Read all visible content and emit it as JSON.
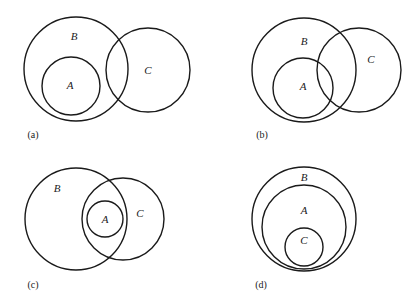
{
  "figure": {
    "panels": [
      {
        "id": "a",
        "caption": "(a)",
        "caption_pos": [
          33,
          136
        ],
        "description": "A is a subset of B; C overlaps B but not A",
        "sets": [
          {
            "name": "B",
            "cx": 76,
            "cy": 69,
            "r": 52,
            "label_pos": [
              74,
              37
            ]
          },
          {
            "name": "A",
            "cx": 71,
            "cy": 86,
            "r": 29,
            "label_pos": [
              70,
              86
            ]
          },
          {
            "name": "C",
            "cx": 148,
            "cy": 70,
            "r": 42,
            "label_pos": [
              148,
              71
            ]
          }
        ]
      },
      {
        "id": "b",
        "caption": "(b)",
        "caption_pos": [
          262,
          136
        ],
        "description": "A is a subset of B; C overlaps both A and B",
        "sets": [
          {
            "name": "B",
            "cx": 304,
            "cy": 70,
            "r": 52,
            "label_pos": [
              304,
              42
            ]
          },
          {
            "name": "A",
            "cx": 303,
            "cy": 88,
            "r": 30,
            "label_pos": [
              303,
              87
            ]
          },
          {
            "name": "C",
            "cx": 359,
            "cy": 70,
            "r": 42,
            "label_pos": [
              371,
              60
            ]
          }
        ]
      },
      {
        "id": "c",
        "caption": "(c)",
        "caption_pos": [
          33,
          286
        ],
        "description": "A is a subset of both B and C; B and C overlap",
        "sets": [
          {
            "name": "B",
            "cx": 76,
            "cy": 219,
            "r": 51,
            "label_pos": [
              57,
              189
            ]
          },
          {
            "name": "C",
            "cx": 123,
            "cy": 219,
            "r": 41,
            "label_pos": [
              140,
              214
            ]
          },
          {
            "name": "A",
            "cx": 105,
            "cy": 219,
            "r": 18,
            "label_pos": [
              105,
              220
            ]
          }
        ]
      },
      {
        "id": "d",
        "caption": "(d)",
        "caption_pos": [
          261,
          286
        ],
        "description": "C is a subset of A, which is a subset of B",
        "sets": [
          {
            "name": "B",
            "cx": 304,
            "cy": 219,
            "r": 52,
            "label_pos": [
              304,
              178
            ]
          },
          {
            "name": "A",
            "cx": 304,
            "cy": 227,
            "r": 42,
            "label_pos": [
              304,
              211
            ]
          },
          {
            "name": "C",
            "cx": 304,
            "cy": 247,
            "r": 19,
            "label_pos": [
              304,
              241
            ]
          }
        ]
      }
    ],
    "stroke_color": "#1a1a1a",
    "background": "#ffffff"
  }
}
